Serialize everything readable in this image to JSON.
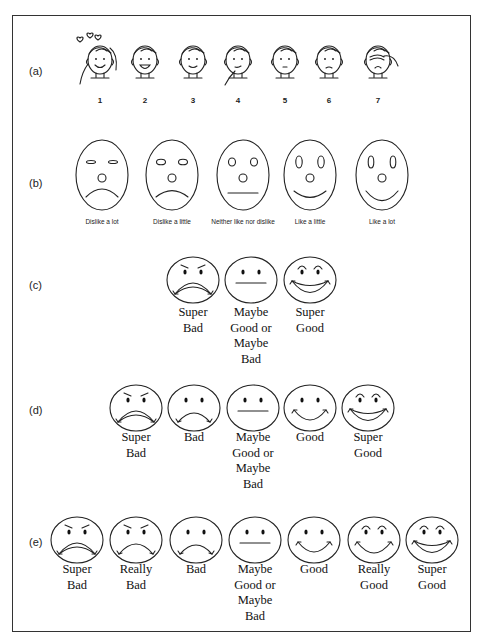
{
  "figure": {
    "rows": [
      {
        "id": "a",
        "label": "(a)",
        "style": "cartoon-child-faces",
        "items": [
          {
            "label": "1",
            "expression": "very happy, hearts above head"
          },
          {
            "label": "2",
            "expression": "happy, open smile"
          },
          {
            "label": "3",
            "expression": "pleased smile"
          },
          {
            "label": "4",
            "expression": "thoughtful, hand on chin"
          },
          {
            "label": "5",
            "expression": "neutral"
          },
          {
            "label": "6",
            "expression": "unhappy"
          },
          {
            "label": "7",
            "expression": "crying, hand over face"
          }
        ]
      },
      {
        "id": "b",
        "label": "(b)",
        "style": "oval-faces",
        "items": [
          {
            "label": "Dislike a lot",
            "mood": -2
          },
          {
            "label": "Dislike a little",
            "mood": -1
          },
          {
            "label": "Neither like nor dislike",
            "mood": 0
          },
          {
            "label": "Like a little",
            "mood": 1
          },
          {
            "label": "Like a lot",
            "mood": 2
          }
        ]
      },
      {
        "id": "c",
        "label": "(c)",
        "style": "round-smileys",
        "items": [
          {
            "label": "Super\nBad",
            "face": "super-bad"
          },
          {
            "label": "Maybe\nGood or\nMaybe\nBad",
            "face": "neutral"
          },
          {
            "label": "Super\nGood",
            "face": "super-good"
          }
        ]
      },
      {
        "id": "d",
        "label": "(d)",
        "style": "round-smileys",
        "items": [
          {
            "label": "Super\nBad",
            "face": "super-bad"
          },
          {
            "label": "Bad",
            "face": "bad"
          },
          {
            "label": "Maybe\nGood or\nMaybe\nBad",
            "face": "neutral"
          },
          {
            "label": "Good",
            "face": "good"
          },
          {
            "label": "Super\nGood",
            "face": "super-good"
          }
        ]
      },
      {
        "id": "e",
        "label": "(e)",
        "style": "round-smileys",
        "items": [
          {
            "label": "Super\nBad",
            "face": "super-bad"
          },
          {
            "label": "Really\nBad",
            "face": "really-bad"
          },
          {
            "label": "Bad",
            "face": "bad"
          },
          {
            "label": "Maybe\nGood or\nMaybe\nBad",
            "face": "neutral"
          },
          {
            "label": "Good",
            "face": "good"
          },
          {
            "label": "Really\nGood",
            "face": "really-good"
          },
          {
            "label": "Super\nGood",
            "face": "super-good"
          }
        ]
      }
    ]
  }
}
